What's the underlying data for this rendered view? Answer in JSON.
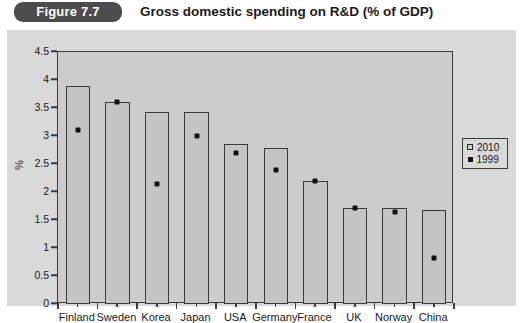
{
  "header": {
    "badge_label": "Figure 7.7",
    "title": "Gross domestic spending on R&D (% of GDP)"
  },
  "legend": {
    "entries": [
      {
        "label": "2010",
        "marker": "square-swatch-icon"
      },
      {
        "label": "1999",
        "marker": "diamond-marker-icon"
      }
    ]
  },
  "chart_data": {
    "type": "bar",
    "title": "Gross domestic spending on R&D (% of GDP)",
    "xlabel": "",
    "ylabel": "%",
    "ylim": [
      0,
      4.5
    ],
    "yticks": [
      "0",
      "0.5",
      "1",
      "1.5",
      "2",
      "2.5",
      "3",
      "3.5",
      "4",
      "4.5"
    ],
    "ytick_values": [
      0,
      0.5,
      1,
      1.5,
      2,
      2.5,
      3,
      3.5,
      4,
      4.5
    ],
    "grid": false,
    "legend_position": "right",
    "categories": [
      "Finland",
      "Sweden",
      "Korea",
      "Japan",
      "USA",
      "Germany",
      "France",
      "UK",
      "Norway",
      "China"
    ],
    "series": [
      {
        "name": "2010",
        "type": "bar",
        "values": [
          3.9,
          3.6,
          3.42,
          3.42,
          2.85,
          2.78,
          2.2,
          1.72,
          1.72,
          1.67
        ]
      },
      {
        "name": "1999",
        "type": "scatter",
        "values": [
          3.1,
          3.6,
          2.15,
          3.0,
          2.7,
          2.4,
          2.2,
          1.72,
          1.65,
          0.82
        ]
      }
    ]
  }
}
